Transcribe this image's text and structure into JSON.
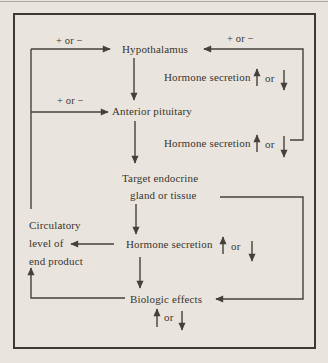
{
  "figure": {
    "background": "#e9e5de",
    "frame_border_color": "#3e3a33",
    "line_color": "#45403a",
    "text_color": "#3a342c"
  },
  "nodes": {
    "hypothalamus": "Hypothalamus",
    "anterior_pituitary": "Anterior pituitary",
    "target_gland_line1": "Target endocrine",
    "target_gland_line2": "gland or tissue",
    "biologic_effects": "Biologic effects",
    "circulatory_line1": "Circulatory",
    "circulatory_line2": "level of",
    "circulatory_line3": "end product"
  },
  "labels": {
    "plus_or_minus_top_left": "+ or −",
    "plus_or_minus_top_right": "+ or −",
    "plus_or_minus_mid_left": "+ or −",
    "hormone_secretion_1": "Hormone secretion",
    "hormone_secretion_2": "Hormone secretion",
    "hormone_secretion_3": "Hormone secretion",
    "or_1": "or",
    "or_2": "or",
    "or_3": "or",
    "or_4": "or"
  },
  "icons": {
    "up_arrow": "↑",
    "down_arrow": "↓"
  },
  "edges": [
    {
      "from": "circulatory-level-of-end-product",
      "to": "hypothalamus",
      "label": "+ or −"
    },
    {
      "from": "circulatory-level-of-end-product",
      "to": "anterior-pituitary",
      "label": "+ or −"
    },
    {
      "from": "hypothalamus",
      "to": "anterior-pituitary",
      "label": "Hormone secretion ↑ or ↓"
    },
    {
      "from": "anterior-pituitary",
      "to": "target-endocrine-gland-or-tissue",
      "label": "Hormone secretion ↑ or ↓"
    },
    {
      "from": "anterior-pituitary-hormone-secretion",
      "to": "hypothalamus",
      "label": "+ or −"
    },
    {
      "from": "target-endocrine-gland-or-tissue",
      "to": "hormone-secretion",
      "label": "Hormone secretion ↑ or ↓"
    },
    {
      "from": "hormone-secretion",
      "to": "circulatory-level-of-end-product",
      "label": ""
    },
    {
      "from": "hormone-secretion",
      "to": "biologic-effects",
      "label": "↑ or ↓"
    },
    {
      "from": "target-endocrine-gland-or-tissue",
      "to": "biologic-effects",
      "label": ""
    },
    {
      "from": "biologic-effects",
      "to": "circulatory-level-of-end-product",
      "label": ""
    }
  ]
}
